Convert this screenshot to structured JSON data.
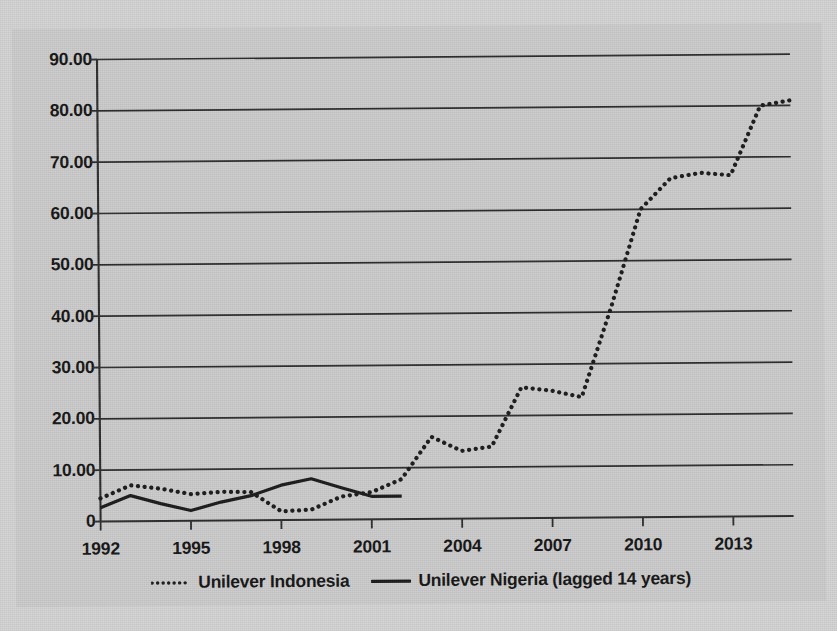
{
  "chart_data": {
    "type": "line",
    "title": "",
    "subtitle": "",
    "xlabel": "",
    "ylabel": "",
    "xlim": [
      1992,
      2015
    ],
    "ylim": [
      0,
      90
    ],
    "grid": true,
    "legend_position": "bottom",
    "x": [
      1992,
      1993,
      1994,
      1995,
      1996,
      1997,
      1998,
      1999,
      2000,
      2001,
      2002,
      2003,
      2004,
      2005,
      2006,
      2007,
      2008,
      2009,
      2010,
      2011,
      2012,
      2013,
      2014,
      2015
    ],
    "y_ticks": [
      0,
      10,
      20,
      30,
      40,
      50,
      60,
      70,
      80,
      90
    ],
    "y_tick_labels": [
      "0",
      "10.00",
      "20.00",
      "30.00",
      "40.00",
      "50.00",
      "60.00",
      "70.00",
      "80.00",
      "90.00"
    ],
    "x_ticks": [
      1992,
      1995,
      1998,
      2001,
      2004,
      2007,
      2010,
      2013
    ],
    "x_tick_labels": [
      "1992",
      "1995",
      "1998",
      "2001",
      "2004",
      "2007",
      "2010",
      "2013"
    ],
    "series": [
      {
        "name": "Unilever Indonesia",
        "style": "dotted",
        "color": "#1a1a1a",
        "x": [
          1992,
          1993,
          1994,
          1995,
          1996,
          1997,
          1998,
          1999,
          2000,
          2001,
          2002,
          2003,
          2004,
          2005,
          2006,
          2007,
          2008,
          2009,
          2010,
          2011,
          2012,
          2013,
          2014,
          2015
        ],
        "values": [
          4.5,
          7.0,
          6.3,
          5.2,
          5.6,
          5.5,
          1.7,
          2.0,
          4.5,
          5.3,
          7.8,
          16.0,
          13.2,
          14.0,
          25.5,
          24.8,
          23.5,
          41.0,
          60.0,
          66.0,
          67.0,
          66.5,
          80.0,
          81.0
        ]
      },
      {
        "name": "Unilever Nigeria (lagged 14 years)",
        "style": "solid",
        "color": "#1a1a1a",
        "x": [
          1992,
          1993,
          1994,
          1995,
          1996,
          1997,
          1998,
          1999,
          2000,
          2001,
          2002
        ],
        "values": [
          2.7,
          5.0,
          3.4,
          2.0,
          3.6,
          4.8,
          6.8,
          8.0,
          6.2,
          4.5,
          4.5
        ]
      }
    ]
  },
  "legend": {
    "entries": [
      {
        "label": "Unilever Indonesia",
        "style": "dotted"
      },
      {
        "label": "Unilever Nigeria (lagged 14 years)",
        "style": "solid"
      }
    ]
  },
  "colors": {
    "page_background": "#d4d4d4",
    "plot_background": "#cccccc",
    "ink": "#1a1a1a",
    "gridline": "#2b2b2b"
  }
}
